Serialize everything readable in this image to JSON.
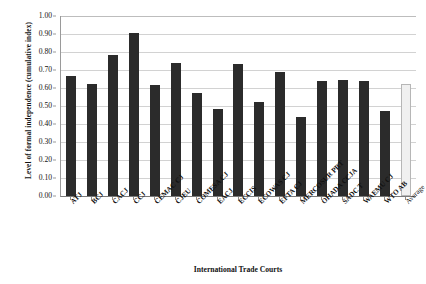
{
  "chart_data": {
    "type": "bar",
    "title": "",
    "xlabel": "International Trade Courts",
    "ylabel": "Level of formal independence (cumulative index)",
    "ylim": [
      0.0,
      1.0
    ],
    "ytick_step": 0.1,
    "grid": true,
    "legend": "none",
    "categories": [
      "ATJ",
      "BCJ",
      "CACJ",
      "CCJ",
      "CEMAC CJ",
      "CJEU",
      "COMESA CJ",
      "EACJ",
      "ECCIS",
      "ECOWAS CJ",
      "EFTA CJ",
      "MERCOSUR PRT",
      "OHADA CCJA",
      "SADC T",
      "WAEMU CJ",
      "WTO AB",
      "Average"
    ],
    "values": [
      0.665,
      0.62,
      0.785,
      0.905,
      0.615,
      0.74,
      0.57,
      0.485,
      0.735,
      0.525,
      0.69,
      0.44,
      0.64,
      0.645,
      0.64,
      0.475,
      0.62
    ],
    "ytick_labels": [
      "0.00",
      "0.10",
      "0.20",
      "0.30",
      "0.40",
      "0.50",
      "0.60",
      "0.70",
      "0.80",
      "0.90",
      "1.00"
    ],
    "ytick_values": [
      0.0,
      0.1,
      0.2,
      0.3,
      0.4,
      0.5,
      0.6,
      0.7,
      0.8,
      0.9,
      1.0
    ],
    "series_color": "#2b2b2b",
    "average_color": "#f0f0f0",
    "average_border_color": "#b6b6b6",
    "gridline_color": "#d2d2d2",
    "axis_color": "#8a8a8a"
  }
}
